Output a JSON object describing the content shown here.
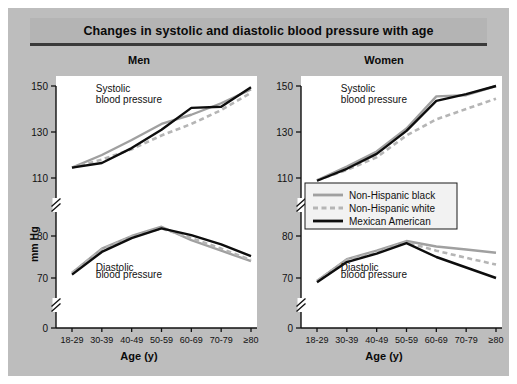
{
  "title": "Changes in systolic and diastolic blood pressure with age",
  "axis": {
    "ylabel": "mm Hg",
    "xlabel": "Age (y)",
    "yticks_upper": [
      110,
      130,
      150
    ],
    "yticks_lower": [
      70,
      80
    ],
    "yzero": 0,
    "ybreaks": 2
  },
  "legend": {
    "position": "center-right",
    "entries": [
      {
        "label": "Non-Hispanic black",
        "color": "#a0a0a0",
        "style": "solid"
      },
      {
        "label": "Non-Hispanic white",
        "color": "#b5b5b5",
        "style": "dashed"
      },
      {
        "label": "Mexican American",
        "color": "#0d0d0d",
        "style": "solid"
      }
    ]
  },
  "annotations": {
    "systolic_line1": "Systolic",
    "systolic_line2": "blood pressure",
    "diastolic_line1": "Diastolic",
    "diastolic_line2": "blood pressure"
  },
  "chart_data": {
    "type": "line",
    "title": "Changes in systolic and diastolic blood pressure with age",
    "xlabel": "Age (y)",
    "ylabel": "mm Hg",
    "categories": [
      "18-29",
      "30-39",
      "40-49",
      "50-59",
      "60-69",
      "70-79",
      "≥80"
    ],
    "grid": false,
    "legend_position": "center-right",
    "y_axis_note": "Broken axis: upper segment 110-150, lower segment 70-80, baseline 0",
    "ylim_upper": [
      110,
      150
    ],
    "ylim_lower": [
      68,
      82
    ],
    "panels": [
      {
        "name": "Men",
        "groups": [
          {
            "measure": "Systolic",
            "series": [
              {
                "name": "Non-Hispanic black",
                "color": "#a0a0a0",
                "style": "solid",
                "values": [
                  114.5,
                  120.0,
                  126.5,
                  133.5,
                  137.5,
                  142.5,
                  148.5
                ]
              },
              {
                "name": "Non-Hispanic white",
                "color": "#b5b5b5",
                "style": "dashed",
                "values": [
                  114.5,
                  118.0,
                  122.5,
                  128.5,
                  133.5,
                  139.5,
                  147.0
                ]
              },
              {
                "name": "Mexican American",
                "color": "#0d0d0d",
                "style": "solid",
                "values": [
                  114.5,
                  116.5,
                  123.0,
                  131.0,
                  140.5,
                  141.0,
                  149.5
                ]
              }
            ]
          },
          {
            "measure": "Diastolic",
            "series": [
              {
                "name": "Non-Hispanic black",
                "color": "#a0a0a0",
                "style": "solid",
                "values": [
                  71.2,
                  77.0,
                  80.0,
                  82.2,
                  79.0,
                  76.5,
                  74.0
                ]
              },
              {
                "name": "Non-Hispanic white",
                "color": "#b5b5b5",
                "style": "dashed",
                "values": [
                  71.2,
                  76.8,
                  79.8,
                  81.8,
                  79.5,
                  77.0,
                  74.3
                ]
              },
              {
                "name": "Mexican American",
                "color": "#0d0d0d",
                "style": "solid",
                "values": [
                  70.8,
                  76.2,
                  79.5,
                  81.8,
                  80.2,
                  78.0,
                  75.2
                ]
              }
            ]
          }
        ]
      },
      {
        "name": "Women",
        "groups": [
          {
            "measure": "Systolic",
            "series": [
              {
                "name": "Non-Hispanic black",
                "color": "#a0a0a0",
                "style": "solid",
                "values": [
                  109.0,
                  115.0,
                  121.5,
                  131.5,
                  145.5,
                  146.0,
                  150.0
                ]
              },
              {
                "name": "Non-Hispanic white",
                "color": "#b5b5b5",
                "style": "dashed",
                "values": [
                  109.0,
                  113.5,
                  119.0,
                  128.5,
                  135.5,
                  140.0,
                  144.5
                ]
              },
              {
                "name": "Mexican American",
                "color": "#0d0d0d",
                "style": "solid",
                "values": [
                  108.8,
                  114.0,
                  120.5,
                  130.5,
                  143.5,
                  146.5,
                  150.0
                ]
              }
            ]
          },
          {
            "measure": "Diastolic",
            "series": [
              {
                "name": "Non-Hispanic black",
                "color": "#a0a0a0",
                "style": "solid",
                "values": [
                  69.3,
                  74.5,
                  76.5,
                  78.8,
                  77.5,
                  76.8,
                  76.0
                ]
              },
              {
                "name": "Non-Hispanic white",
                "color": "#b5b5b5",
                "style": "dashed",
                "values": [
                  69.3,
                  74.3,
                  76.2,
                  78.5,
                  76.5,
                  74.8,
                  73.2
                ]
              },
              {
                "name": "Mexican American",
                "color": "#0d0d0d",
                "style": "solid",
                "values": [
                  69.0,
                  73.8,
                  75.8,
                  78.3,
                  75.0,
                  72.5,
                  70.0
                ]
              }
            ]
          }
        ]
      }
    ]
  }
}
